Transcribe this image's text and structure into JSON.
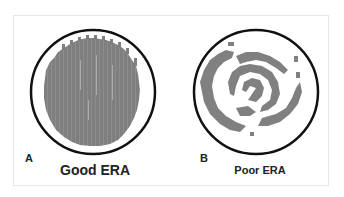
{
  "figure": {
    "panels": [
      {
        "letter": "A",
        "caption": "Good ERA",
        "pattern": "uniform-dense-striated"
      },
      {
        "letter": "B",
        "caption": "Poor ERA",
        "pattern": "fragmented-spiral"
      }
    ],
    "colors": {
      "circle_outline": "#111111",
      "fill_gray": "#808080",
      "frame_border": "#e6e6e6",
      "background": "#ffffff"
    }
  }
}
